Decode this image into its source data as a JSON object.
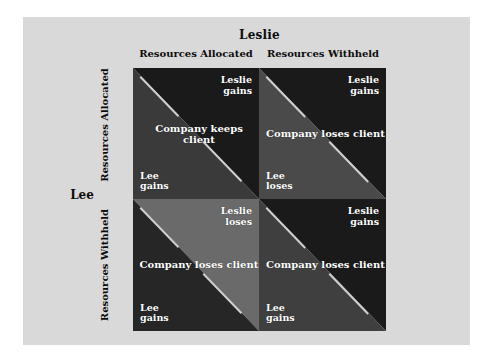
{
  "diagram": {
    "type": "payoff-matrix",
    "column_axis_title": "Leslie",
    "row_axis_title": "Lee",
    "column_headers": [
      "Resources Allocated",
      "Resources Withheld"
    ],
    "row_headers": [
      "Resources Allocated",
      "Resources Withheld"
    ],
    "colors": {
      "page_background": "#ffffff",
      "panel_background": "#d9d9d9",
      "shade_dark": "#1a1a1a",
      "shade_medium": "#3a3a3a",
      "shade_light": "#6a6a6a",
      "stripe": "#cfcfcf",
      "cell_text": "#ffffff",
      "axis_text": "#0d0d0d"
    },
    "cells": [
      {
        "row": "Resources Allocated",
        "column": "Resources Allocated",
        "leslie_outcome_line1": "Leslie",
        "leslie_outcome_line2": "gains",
        "lee_outcome_line1": "Lee",
        "lee_outcome_line2": "gains",
        "company_line1": "Company",
        "company_line2": "keeps client",
        "upper_shade": "#1a1a1a",
        "lower_shade": "#3a3a3a"
      },
      {
        "row": "Resources Allocated",
        "column": "Resources Withheld",
        "leslie_outcome_line1": "Leslie",
        "leslie_outcome_line2": "gains",
        "lee_outcome_line1": "Lee",
        "lee_outcome_line2": "loses",
        "company_line1": "Company",
        "company_line2": "loses client",
        "upper_shade": "#1a1a1a",
        "lower_shade": "#4a4a4a"
      },
      {
        "row": "Resources Withheld",
        "column": "Resources Allocated",
        "leslie_outcome_line1": "Leslie",
        "leslie_outcome_line2": "loses",
        "lee_outcome_line1": "Lee",
        "lee_outcome_line2": "gains",
        "upper_shade": "#6a6a6a",
        "lower_shade": "#262626",
        "company_line1": "Company",
        "company_line2": "loses client"
      },
      {
        "row": "Resources Withheld",
        "column": "Resources Withheld",
        "leslie_outcome_line1": "Leslie",
        "leslie_outcome_line2": "gains",
        "lee_outcome_line1": "Lee",
        "lee_outcome_line2": "gains",
        "company_line1": "Company",
        "company_line2": "loses client",
        "upper_shade": "#1a1a1a",
        "lower_shade": "#3f3f3f"
      }
    ]
  }
}
